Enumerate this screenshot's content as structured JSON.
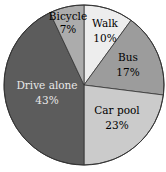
{
  "chart_data": {
    "type": "pie",
    "title": "",
    "start_angle": "12 o'clock",
    "direction": "clockwise",
    "categories": [
      "Walk",
      "Bus",
      "Car pool",
      "Drive alone",
      "Bicycle"
    ],
    "values": [
      10,
      17,
      23,
      43,
      7
    ],
    "labels": [
      "Walk 10%",
      "Bus 17%",
      "Car pool 23%",
      "Drive alone 43%",
      "Bicycle 7%"
    ],
    "colors": [
      "#ededed",
      "#9c9c9c",
      "#cbcbcb",
      "#5c5c5c",
      "#acacac"
    ],
    "legend": "none (labels inside slices)"
  },
  "slices": [
    {
      "name": "Walk",
      "pct": "10%",
      "color": "#ededed",
      "text_color": "#333333"
    },
    {
      "name": "Bus",
      "pct": "17%",
      "color": "#9c9c9c",
      "text_color": "#222222"
    },
    {
      "name": "Car pool",
      "pct": "23%",
      "color": "#cbcbcb",
      "text_color": "#222222"
    },
    {
      "name": "Drive alone",
      "pct": "43%",
      "color": "#5c5c5c",
      "text_color": "#e8e8e8"
    },
    {
      "name": "Bicycle",
      "pct": "7%",
      "color": "#acacac",
      "text_color": "#222222"
    }
  ]
}
